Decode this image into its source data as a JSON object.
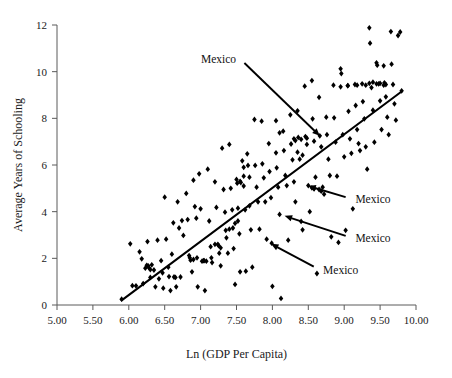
{
  "chart_data": {
    "type": "scatter",
    "title": "",
    "xlabel": "Ln (GDP Per Capita)",
    "ylabel": "Average Years of Schooling",
    "xlim": [
      5.0,
      10.0
    ],
    "ylim": [
      0,
      12
    ],
    "xticks": [
      "5.00",
      "5.50",
      "6.00",
      "6.50",
      "7.00",
      "7.50",
      "8.00",
      "8.50",
      "9.00",
      "9.50",
      "10.00"
    ],
    "xtick_values": [
      5.0,
      5.5,
      6.0,
      6.5,
      7.0,
      7.5,
      8.0,
      8.5,
      9.0,
      9.5,
      10.0
    ],
    "yticks": [
      "0",
      "2",
      "4",
      "6",
      "8",
      "10",
      "12"
    ],
    "ytick_values": [
      0,
      2,
      4,
      6,
      8,
      10,
      12
    ],
    "grid": false,
    "legend": "none",
    "marker": "diamond",
    "marker_color": "#000000",
    "trendline": {
      "type": "linear",
      "color": "#000000",
      "x_start": 5.9,
      "y_start": 0.2,
      "x_end": 9.8,
      "y_end": 9.15
    },
    "annotations": [
      {
        "text": "Mexico",
        "label_x": 7.55,
        "label_y": 10.55,
        "point_x": 8.66,
        "point_y": 7.25
      },
      {
        "text": "Mexico",
        "label_x": 9.1,
        "label_y": 4.55,
        "point_x": 8.5,
        "point_y": 5.1
      },
      {
        "text": "Mexico",
        "label_x": 9.1,
        "label_y": 2.88,
        "point_x": 8.17,
        "point_y": 3.82
      },
      {
        "text": "Mexico",
        "label_x": 8.65,
        "label_y": 1.52,
        "point_x": 7.98,
        "point_y": 2.62
      }
    ],
    "points": [
      [
        5.9,
        0.25
      ],
      [
        6.02,
        2.62
      ],
      [
        6.05,
        0.83
      ],
      [
        6.1,
        0.82
      ],
      [
        6.15,
        2.28
      ],
      [
        6.18,
        1.98
      ],
      [
        6.2,
        0.92
      ],
      [
        6.23,
        1.58
      ],
      [
        6.26,
        2.72
      ],
      [
        6.27,
        1.68
      ],
      [
        6.3,
        1.52
      ],
      [
        6.3,
        1.18
      ],
      [
        6.32,
        1.72
      ],
      [
        6.35,
        1.5
      ],
      [
        6.37,
        0.78
      ],
      [
        6.4,
        2.78
      ],
      [
        6.42,
        1.12
      ],
      [
        6.45,
        1.9
      ],
      [
        6.47,
        1.38
      ],
      [
        6.48,
        0.72
      ],
      [
        6.5,
        4.62
      ],
      [
        6.52,
        2.82
      ],
      [
        6.55,
        1.62
      ],
      [
        6.56,
        1.22
      ],
      [
        6.58,
        0.62
      ],
      [
        6.6,
        2.18
      ],
      [
        6.62,
        3.52
      ],
      [
        6.63,
        1.2
      ],
      [
        6.65,
        1.18
      ],
      [
        6.66,
        0.78
      ],
      [
        6.68,
        4.42
      ],
      [
        6.7,
        3.3
      ],
      [
        6.72,
        1.2
      ],
      [
        6.74,
        3.62
      ],
      [
        6.76,
        2.98
      ],
      [
        6.8,
        4.78
      ],
      [
        6.82,
        3.66
      ],
      [
        6.84,
        2.12
      ],
      [
        6.86,
        1.92
      ],
      [
        6.88,
        1.42
      ],
      [
        6.9,
        5.35
      ],
      [
        6.92,
        4.22
      ],
      [
        6.94,
        3.72
      ],
      [
        6.95,
        2.02
      ],
      [
        6.96,
        0.78
      ],
      [
        6.98,
        5.62
      ],
      [
        7.0,
        4.12
      ],
      [
        7.02,
        1.88
      ],
      [
        7.04,
        1.9
      ],
      [
        7.06,
        0.62
      ],
      [
        7.1,
        5.82
      ],
      [
        7.12,
        3.6
      ],
      [
        7.14,
        2.5
      ],
      [
        7.15,
        2.02
      ],
      [
        7.16,
        1.82
      ],
      [
        7.2,
        5.28
      ],
      [
        7.22,
        4.18
      ],
      [
        7.24,
        2.6
      ],
      [
        7.26,
        2.22
      ],
      [
        7.28,
        1.68
      ],
      [
        7.3,
        6.72
      ],
      [
        7.32,
        4.95
      ],
      [
        7.34,
        3.98
      ],
      [
        7.36,
        2.88
      ],
      [
        7.38,
        2.22
      ],
      [
        7.4,
        6.88
      ],
      [
        7.42,
        5.0
      ],
      [
        7.44,
        4.08
      ],
      [
        7.46,
        2.42
      ],
      [
        7.48,
        0.88
      ],
      [
        7.5,
        5.38
      ],
      [
        7.51,
        5.22
      ],
      [
        7.52,
        4.15
      ],
      [
        7.54,
        3.05
      ],
      [
        7.55,
        1.42
      ],
      [
        7.58,
        6.18
      ],
      [
        7.6,
        5.9
      ],
      [
        7.6,
        5.1
      ],
      [
        7.62,
        4.08
      ],
      [
        7.63,
        1.45
      ],
      [
        7.65,
        6.48
      ],
      [
        7.66,
        5.98
      ],
      [
        7.68,
        4.25
      ],
      [
        7.7,
        3.22
      ],
      [
        7.72,
        1.62
      ],
      [
        7.75,
        7.95
      ],
      [
        7.76,
        5.98
      ],
      [
        7.78,
        5.05
      ],
      [
        7.8,
        4.42
      ],
      [
        7.82,
        3.25
      ],
      [
        7.85,
        7.88
      ],
      [
        7.86,
        6.05
      ],
      [
        7.88,
        5.45
      ],
      [
        7.9,
        4.42
      ],
      [
        7.92,
        2.82
      ],
      [
        7.95,
        6.92
      ],
      [
        7.96,
        5.72
      ],
      [
        7.98,
        4.6
      ],
      [
        7.99,
        2.65
      ],
      [
        8.0,
        0.8
      ],
      [
        8.05,
        6.52
      ],
      [
        8.06,
        5.88
      ],
      [
        8.08,
        5.05
      ],
      [
        8.1,
        3.88
      ],
      [
        8.12,
        0.28
      ],
      [
        8.15,
        7.45
      ],
      [
        8.16,
        6.62
      ],
      [
        8.18,
        5.55
      ],
      [
        8.2,
        5.12
      ],
      [
        8.22,
        2.78
      ],
      [
        8.25,
        8.15
      ],
      [
        8.26,
        6.9
      ],
      [
        8.28,
        6.22
      ],
      [
        8.3,
        5.28
      ],
      [
        8.32,
        4.42
      ],
      [
        8.35,
        8.32
      ],
      [
        8.36,
        7.18
      ],
      [
        8.38,
        6.25
      ],
      [
        8.4,
        3.58
      ],
      [
        8.42,
        3.22
      ],
      [
        8.45,
        9.38
      ],
      [
        8.46,
        7.22
      ],
      [
        8.48,
        6.88
      ],
      [
        8.5,
        5.12
      ],
      [
        8.52,
        4.0
      ],
      [
        8.55,
        9.62
      ],
      [
        8.56,
        7.98
      ],
      [
        8.58,
        7.02
      ],
      [
        8.6,
        5.48
      ],
      [
        8.62,
        1.35
      ],
      [
        8.65,
        8.9
      ],
      [
        8.66,
        7.25
      ],
      [
        8.68,
        6.78
      ],
      [
        8.7,
        5.05
      ],
      [
        8.72,
        4.75
      ],
      [
        8.75,
        8.05
      ],
      [
        8.76,
        7.3
      ],
      [
        8.78,
        6.25
      ],
      [
        8.8,
        5.55
      ],
      [
        8.82,
        2.92
      ],
      [
        8.85,
        9.42
      ],
      [
        8.86,
        8.02
      ],
      [
        8.88,
        6.98
      ],
      [
        8.9,
        5.52
      ],
      [
        8.92,
        2.68
      ],
      [
        8.95,
        10.12
      ],
      [
        8.96,
        9.92
      ],
      [
        8.98,
        7.3
      ],
      [
        9.0,
        6.35
      ],
      [
        9.02,
        3.2
      ],
      [
        9.05,
        9.4
      ],
      [
        9.06,
        8.3
      ],
      [
        9.08,
        7.12
      ],
      [
        9.1,
        6.5
      ],
      [
        9.12,
        4.12
      ],
      [
        9.15,
        9.45
      ],
      [
        9.16,
        8.55
      ],
      [
        9.18,
        7.52
      ],
      [
        9.2,
        6.92
      ],
      [
        9.22,
        6.62
      ],
      [
        9.25,
        9.48
      ],
      [
        9.26,
        8.72
      ],
      [
        9.28,
        7.98
      ],
      [
        9.3,
        6.78
      ],
      [
        9.32,
        5.82
      ],
      [
        9.35,
        11.88
      ],
      [
        9.36,
        11.22
      ],
      [
        9.38,
        9.32
      ],
      [
        9.4,
        8.35
      ],
      [
        9.42,
        6.98
      ],
      [
        9.45,
        10.38
      ],
      [
        9.46,
        10.28
      ],
      [
        9.48,
        9.48
      ],
      [
        9.5,
        8.75
      ],
      [
        9.52,
        7.52
      ],
      [
        9.55,
        10.25
      ],
      [
        9.56,
        9.52
      ],
      [
        9.58,
        8.92
      ],
      [
        9.6,
        8.05
      ],
      [
        9.62,
        7.3
      ],
      [
        9.65,
        11.72
      ],
      [
        9.66,
        10.32
      ],
      [
        9.68,
        9.45
      ],
      [
        9.7,
        8.62
      ],
      [
        9.72,
        7.92
      ],
      [
        9.75,
        11.55
      ],
      [
        9.78,
        11.7
      ],
      [
        9.8,
        9.18
      ],
      [
        9.55,
        9.42
      ],
      [
        9.45,
        9.48
      ],
      [
        9.3,
        9.42
      ],
      [
        9.18,
        9.42
      ],
      [
        9.05,
        9.4
      ],
      [
        8.95,
        9.35
      ],
      [
        6.25,
        1.7
      ],
      [
        6.28,
        1.6
      ],
      [
        7.55,
        5.3
      ],
      [
        7.56,
        5.25
      ],
      [
        7.6,
        5.52
      ],
      [
        7.68,
        5.48
      ],
      [
        8.05,
        7.9
      ],
      [
        8.1,
        7.38
      ],
      [
        8.3,
        7.12
      ],
      [
        8.32,
        7.05
      ],
      [
        8.4,
        7.1
      ],
      [
        8.48,
        7.15
      ],
      [
        8.35,
        6.55
      ],
      [
        8.42,
        6.42
      ],
      [
        7.35,
        3.2
      ],
      [
        7.4,
        3.25
      ],
      [
        7.45,
        3.3
      ],
      [
        7.48,
        3.5
      ],
      [
        7.52,
        3.6
      ],
      [
        7.2,
        2.6
      ],
      [
        7.25,
        2.55
      ],
      [
        7.28,
        2.45
      ],
      [
        6.85,
        2.02
      ],
      [
        6.9,
        1.95
      ],
      [
        7.05,
        1.9
      ],
      [
        7.08,
        1.88
      ],
      [
        8.65,
        4.95
      ],
      [
        8.68,
        4.88
      ],
      [
        8.55,
        5.02
      ],
      [
        8.58,
        4.98
      ],
      [
        9.35,
        9.5
      ],
      [
        9.4,
        9.55
      ],
      [
        9.5,
        9.5
      ],
      [
        9.58,
        9.45
      ]
    ]
  }
}
